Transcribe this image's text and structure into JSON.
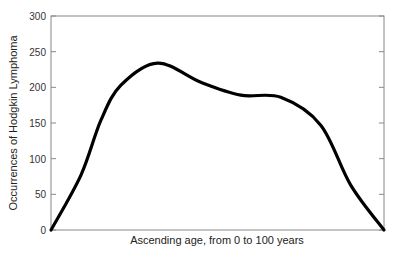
{
  "chart_data": {
    "type": "line",
    "title": "",
    "xlabel": "Ascending age, from 0 to 100 years",
    "ylabel": "Occurrences of Hodgkin Lymphoma",
    "ylim": [
      0,
      300
    ],
    "xlim": [
      0,
      100
    ],
    "yticks": [
      0,
      50,
      100,
      150,
      200,
      250,
      300
    ],
    "xticks": [],
    "grid": false,
    "legend": null,
    "series": [
      {
        "name": "Hodgkin Lymphoma occurrences",
        "color": "#000000",
        "x": [
          0,
          9,
          15,
          21,
          32,
          45,
          57,
          69,
          81,
          90,
          100
        ],
        "y": [
          0,
          77,
          154,
          203,
          234,
          207,
          189,
          186,
          147,
          63,
          0
        ]
      }
    ]
  },
  "axes": {
    "xlabel": "Ascending age, from 0 to 100 years",
    "ylabel": "Occurrences of Hodgkin Lymphoma"
  }
}
